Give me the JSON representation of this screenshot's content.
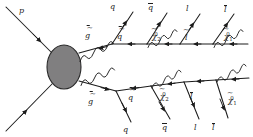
{
  "figure": {
    "background_color": "#ffffff",
    "line_color": "#1c1c1c",
    "blob_fill": "#807f80",
    "blob_stroke": "#2a2a2a",
    "width": 253,
    "height": 137
  },
  "blob": {
    "name": "hard-interaction-blob",
    "cx": 64,
    "cy": 67,
    "rx": 17,
    "ry": 22
  },
  "incoming": [
    {
      "id": "p-upper",
      "label": "p",
      "kind": "proton",
      "x1": 6,
      "y1": 8,
      "x2": 50,
      "y2": 52
    },
    {
      "id": "p-lower",
      "label": "",
      "kind": "proton",
      "x1": 6,
      "y1": 130,
      "x2": 50,
      "y2": 84
    }
  ],
  "propagators": {
    "gluino_upper": {
      "label": "g",
      "decorated": "antigluino",
      "kind": "gluino-spring"
    },
    "gluino_lower": {
      "label": "g",
      "decorated": "antigluino",
      "kind": "gluino-spring"
    },
    "squark_upper": {
      "label": "q",
      "kind": "squark"
    },
    "squark_lower": {
      "label": "q",
      "kind": "squark"
    },
    "neutralino2_upper": {
      "label": "χ",
      "sub": "2",
      "sup": "0",
      "kind": "neutralino-spring"
    },
    "neutralino2_lower": {
      "label": "χ",
      "sub": "2",
      "sup": "0",
      "kind": "neutralino-spring"
    },
    "slepton_upper": {
      "label": "l",
      "kind": "slepton"
    },
    "slepton_lower": {
      "label": "l",
      "kind": "slepton"
    },
    "neutralino1_upper": {
      "label": "χ",
      "sub": "1",
      "sup": "0",
      "kind": "neutralino-spring"
    },
    "neutralino1_lower": {
      "label": "χ",
      "sub": "1",
      "sup": "0",
      "kind": "neutralino-spring"
    }
  },
  "labels": [
    {
      "id": "label-p",
      "name": "proton-label",
      "text": "p",
      "bar": false,
      "tilde": false,
      "x": 19,
      "y": 7
    },
    {
      "id": "label-gluino-upper",
      "name": "gluino-upper-label",
      "text": "g",
      "bar": true,
      "tilde": true,
      "x": 85,
      "y": 32
    },
    {
      "id": "label-q-upper",
      "name": "quark-upper-label",
      "text": "q",
      "bar": false,
      "tilde": false,
      "x": 110,
      "y": 3
    },
    {
      "id": "label-squark-upper",
      "name": "squark-upper-label",
      "text": "q",
      "bar": true,
      "tilde": true,
      "x": 117,
      "y": 33
    },
    {
      "id": "label-qbar-upper",
      "name": "antiquark-upper-label",
      "text": "q",
      "bar": true,
      "tilde": false,
      "x": 148,
      "y": 4
    },
    {
      "id": "label-chi2-upper",
      "name": "neutralino2-upper-label",
      "text": "χ",
      "sub": "2",
      "sup": "0",
      "bar": false,
      "tilde": true,
      "x": 152,
      "y": 32
    },
    {
      "id": "label-lepton-upper",
      "name": "lepton-upper-label",
      "text": "l",
      "bar": false,
      "tilde": false,
      "x": 186,
      "y": 5
    },
    {
      "id": "label-slepton-upper",
      "name": "slepton-upper-label",
      "text": "l",
      "bar": false,
      "tilde": true,
      "x": 185,
      "y": 34
    },
    {
      "id": "label-antilepton-upper",
      "name": "antilepton-upper-label",
      "text": "l",
      "bar": true,
      "tilde": false,
      "x": 224,
      "y": 6
    },
    {
      "id": "label-chi1-upper",
      "name": "neutralino1-upper-label",
      "text": "χ",
      "sub": "1",
      "sup": "0",
      "bar": false,
      "tilde": true,
      "x": 224,
      "y": 32
    },
    {
      "id": "label-gluino-lower",
      "name": "gluino-lower-label",
      "text": "g",
      "bar": true,
      "tilde": true,
      "x": 88,
      "y": 98
    },
    {
      "id": "label-q-lower",
      "name": "quark-lower-label",
      "text": "q",
      "bar": false,
      "tilde": false,
      "x": 123,
      "y": 126
    },
    {
      "id": "label-squark-lower",
      "name": "squark-lower-label",
      "text": "q",
      "bar": true,
      "tilde": true,
      "x": 128,
      "y": 94
    },
    {
      "id": "label-qbar-lower",
      "name": "antiquark-lower-label",
      "text": "q",
      "bar": true,
      "tilde": false,
      "x": 162,
      "y": 124
    },
    {
      "id": "label-chi2-lower",
      "name": "neutralino2-lower-label",
      "text": "χ",
      "sub": "2",
      "sup": "0",
      "bar": false,
      "tilde": true,
      "x": 160,
      "y": 92
    },
    {
      "id": "label-lepton-lower",
      "name": "lepton-lower-label",
      "text": "l",
      "bar": false,
      "tilde": false,
      "x": 194,
      "y": 124
    },
    {
      "id": "label-slepton-lower",
      "name": "slepton-lower-label",
      "text": "l",
      "bar": true,
      "tilde": false,
      "x": 190,
      "y": 93
    },
    {
      "id": "label-antilepton-lower",
      "name": "antilepton-lower-label",
      "text": "l",
      "bar": true,
      "tilde": false,
      "x": 212,
      "y": 124
    },
    {
      "id": "label-chi1-lower",
      "name": "neutralino1-lower-label",
      "text": "χ",
      "sub": "1",
      "sup": "0",
      "bar": false,
      "tilde": true,
      "x": 228,
      "y": 96
    }
  ]
}
